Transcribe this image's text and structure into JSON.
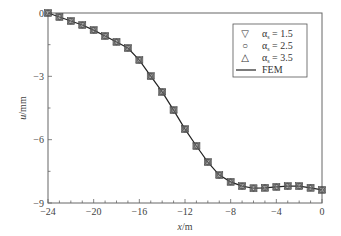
{
  "chart_data": {
    "type": "line",
    "title": "",
    "xlabel": "x/m",
    "ylabel": "u/mm",
    "xlim": [
      -24,
      0
    ],
    "ylim": [
      -9,
      0
    ],
    "xticks": [
      -24,
      -20,
      -16,
      -12,
      -8,
      -4,
      0
    ],
    "yticks": [
      0,
      -3,
      -6,
      -9
    ],
    "xtick_labels": [
      "−24",
      "−20",
      "−16",
      "−12",
      "−8",
      "−4",
      "0"
    ],
    "ytick_labels": [
      "0",
      "−3",
      "−6",
      "−9"
    ],
    "grid": false,
    "legend_position": "upper right",
    "x": [
      -24,
      -23,
      -22,
      -21,
      -20,
      -19,
      -18,
      -17,
      -16,
      -15,
      -14,
      -13,
      -12,
      -11,
      -10,
      -9,
      -8,
      -7,
      -6,
      -5,
      -4,
      -3,
      -2,
      -1,
      0
    ],
    "series": [
      {
        "name": "αs = 1.5",
        "marker": "triangle-down",
        "values": [
          0,
          -0.19,
          -0.38,
          -0.57,
          -0.81,
          -1.09,
          -1.37,
          -1.66,
          -2.23,
          -2.99,
          -3.74,
          -4.6,
          -5.5,
          -6.3,
          -7.06,
          -7.68,
          -8.0,
          -8.2,
          -8.3,
          -8.28,
          -8.24,
          -8.2,
          -8.2,
          -8.28,
          -8.38
        ]
      },
      {
        "name": "αs = 2.5",
        "marker": "circle",
        "values": [
          0,
          -0.19,
          -0.38,
          -0.57,
          -0.81,
          -1.09,
          -1.37,
          -1.66,
          -2.23,
          -2.99,
          -3.74,
          -4.6,
          -5.5,
          -6.3,
          -7.06,
          -7.68,
          -8.0,
          -8.2,
          -8.3,
          -8.28,
          -8.24,
          -8.2,
          -8.2,
          -8.28,
          -8.38
        ]
      },
      {
        "name": "αs = 3.5",
        "marker": "triangle-up",
        "values": [
          0,
          -0.19,
          -0.38,
          -0.57,
          -0.81,
          -1.09,
          -1.37,
          -1.66,
          -2.23,
          -2.99,
          -3.74,
          -4.6,
          -5.5,
          -6.3,
          -7.06,
          -7.68,
          -8.0,
          -8.2,
          -8.3,
          -8.28,
          -8.24,
          -8.2,
          -8.2,
          -8.28,
          -8.38
        ]
      },
      {
        "name": "FEM",
        "marker": "line",
        "values": [
          0,
          -0.19,
          -0.38,
          -0.57,
          -0.81,
          -1.09,
          -1.37,
          -1.66,
          -2.23,
          -2.99,
          -3.74,
          -4.6,
          -5.5,
          -6.3,
          -7.06,
          -7.68,
          -8.0,
          -8.2,
          -8.3,
          -8.28,
          -8.24,
          -8.2,
          -8.2,
          -8.28,
          -8.38
        ]
      }
    ]
  },
  "legend": {
    "items": [
      {
        "symbol": "▽",
        "label_alpha": "α",
        "label_sub": "s",
        "label_rest": " = 1.5"
      },
      {
        "symbol": "○",
        "label_alpha": "α",
        "label_sub": "s",
        "label_rest": " = 2.5"
      },
      {
        "symbol": "△",
        "label_alpha": "α",
        "label_sub": "s",
        "label_rest": " = 3.5"
      },
      {
        "symbol": "line",
        "label_alpha": "",
        "label_sub": "",
        "label_rest": "FEM"
      }
    ]
  },
  "axes": {
    "xlabel_italic": "x",
    "xlabel_unit": "/m",
    "ylabel_italic": "u",
    "ylabel_unit": "/mm"
  }
}
